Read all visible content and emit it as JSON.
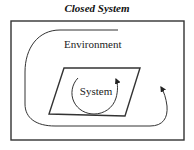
{
  "title": "Closed System",
  "labels": {
    "environment": "Environment",
    "system": "System"
  },
  "elements": {
    "outer_boundary": "environment-box",
    "inner_boundary": "system-parallelogram",
    "inner_flow": "circular-arrow",
    "outer_flow": "curved-arrow"
  },
  "colors": {
    "stroke": "#333333",
    "background": "#ffffff",
    "text": "#222222"
  }
}
